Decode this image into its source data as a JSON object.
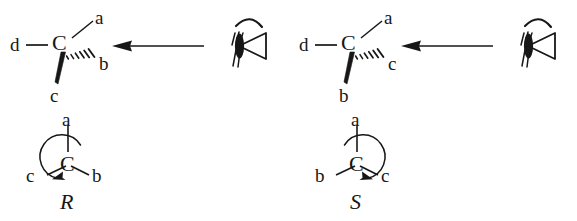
{
  "diagram": {
    "background_color": "#ffffff",
    "ink_color": "#171717"
  },
  "panels": [
    {
      "id": "panel-r",
      "configuration": "R",
      "structure": {
        "center_atom": "C",
        "substituents": {
          "plain_left": "d",
          "plain_up_right": "a",
          "hashed_wedge": "b",
          "bold_wedge": "c"
        }
      },
      "viewer": {
        "icon": "eye-icon",
        "arrow": "left-arrow-icon",
        "arrow_direction": "left"
      },
      "newman_circle": {
        "center_atom": "C",
        "top": "a",
        "left": "c",
        "right": "b",
        "rotation": "counterclockwise",
        "label": "R"
      }
    },
    {
      "id": "panel-s",
      "configuration": "S",
      "structure": {
        "center_atom": "C",
        "substituents": {
          "plain_left": "d",
          "plain_up_right": "a",
          "hashed_wedge": "c",
          "bold_wedge": "b"
        }
      },
      "viewer": {
        "icon": "eye-icon",
        "arrow": "left-arrow-icon",
        "arrow_direction": "left"
      },
      "newman_circle": {
        "center_atom": "C",
        "top": "a",
        "left": "b",
        "right": "c",
        "rotation": "clockwise",
        "label": "S"
      }
    }
  ]
}
